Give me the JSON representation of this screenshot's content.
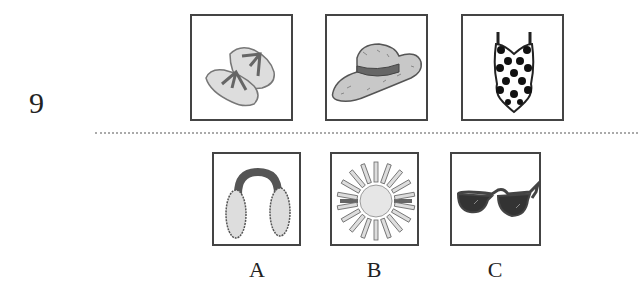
{
  "question": {
    "number": "9",
    "prompt_items": [
      {
        "icon": "flip-flops-icon"
      },
      {
        "icon": "sun-hat-icon"
      },
      {
        "icon": "swimsuit-icon"
      }
    ],
    "options": [
      {
        "label": "A",
        "icon": "earmuffs-icon"
      },
      {
        "label": "B",
        "icon": "sun-icon"
      },
      {
        "label": "C",
        "icon": "sunglasses-icon"
      }
    ]
  }
}
